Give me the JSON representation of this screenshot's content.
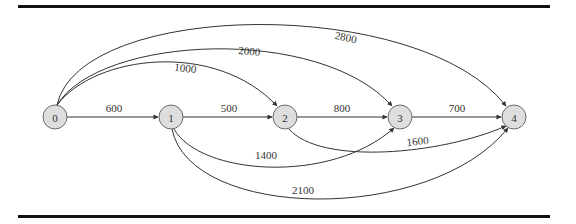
{
  "diagram": {
    "type": "directed-weighted-graph",
    "colors": {
      "node_fill": "#dedede",
      "node_stroke": "#6a6a6a",
      "edge": "#333333",
      "rule": "#111111"
    },
    "nodes": [
      {
        "id": "0",
        "label": "0",
        "x": 55,
        "y": 117
      },
      {
        "id": "1",
        "label": "1",
        "x": 171,
        "y": 117
      },
      {
        "id": "2",
        "label": "2",
        "x": 285,
        "y": 117
      },
      {
        "id": "3",
        "label": "3",
        "x": 400,
        "y": 117
      },
      {
        "id": "4",
        "label": "4",
        "x": 514,
        "y": 117
      }
    ],
    "edges": [
      {
        "from": "0",
        "to": "1",
        "weight": "600"
      },
      {
        "from": "1",
        "to": "2",
        "weight": "500"
      },
      {
        "from": "2",
        "to": "3",
        "weight": "800"
      },
      {
        "from": "3",
        "to": "4",
        "weight": "700"
      },
      {
        "from": "0",
        "to": "2",
        "weight": "1000"
      },
      {
        "from": "0",
        "to": "3",
        "weight": "2000"
      },
      {
        "from": "0",
        "to": "4",
        "weight": "2800"
      },
      {
        "from": "1",
        "to": "3",
        "weight": "1400"
      },
      {
        "from": "2",
        "to": "4",
        "weight": "1600"
      },
      {
        "from": "1",
        "to": "4",
        "weight": "2100"
      }
    ]
  }
}
